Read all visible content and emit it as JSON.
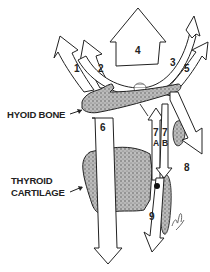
{
  "diagram": {
    "type": "anatomical-force-vectors",
    "structures": {
      "hyoid": "HYOID BONE",
      "thyroid_line1": "THYROID",
      "thyroid_line2": "CARTILAGE"
    },
    "arrows": [
      {
        "id": "1",
        "label": "1",
        "direction": "up-left"
      },
      {
        "id": "2",
        "label": "2",
        "direction": "up-left"
      },
      {
        "id": "3",
        "label": "3",
        "direction": "up-right"
      },
      {
        "id": "4",
        "label": "4",
        "direction": "up"
      },
      {
        "id": "5",
        "label": "5",
        "direction": "up-right"
      },
      {
        "id": "6",
        "label": "6",
        "direction": "down"
      },
      {
        "id": "7A",
        "label": "7",
        "sub": "A",
        "direction": "up"
      },
      {
        "id": "7B",
        "label": "7",
        "sub": "B",
        "direction": "down"
      },
      {
        "id": "8",
        "label": "8",
        "direction": "down-right"
      },
      {
        "id": "9",
        "label": "9",
        "direction": "down"
      }
    ],
    "signature": "wl"
  }
}
